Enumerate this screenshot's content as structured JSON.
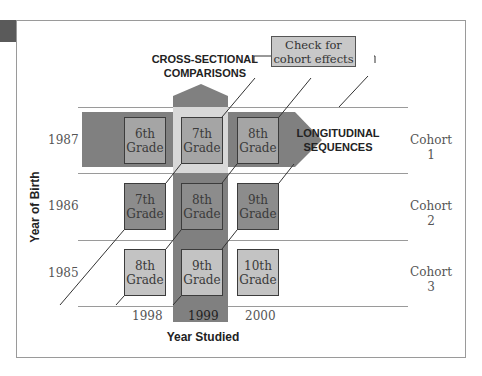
{
  "title_cross_sectional": [
    "CROSS-SECTIONAL",
    "COMPARISONS"
  ],
  "callout": [
    "Check for",
    "cohort effects"
  ],
  "longitudinal": [
    "LONGITUDINAL",
    "SEQUENCES"
  ],
  "y_axis_label": "Year of Birth",
  "x_axis_label": "Year Studied",
  "rows": [
    {
      "year": "1987",
      "cohort": [
        "Cohort",
        "1"
      ],
      "cells": [
        [
          "6th",
          "Grade"
        ],
        [
          "7th",
          "Grade"
        ],
        [
          "8th",
          "Grade"
        ]
      ]
    },
    {
      "year": "1986",
      "cohort": [
        "Cohort",
        "2"
      ],
      "cells": [
        [
          "7th",
          "Grade"
        ],
        [
          "8th",
          "Grade"
        ],
        [
          "9th",
          "Grade"
        ]
      ]
    },
    {
      "year": "1985",
      "cohort": [
        "Cohort",
        "3"
      ],
      "cells": [
        [
          "8th",
          "Grade"
        ],
        [
          "9th",
          "Grade"
        ],
        [
          "10th",
          "Grade"
        ]
      ]
    }
  ],
  "columns": [
    "1998",
    "1999",
    "2000"
  ],
  "colors": {
    "band": "#808080",
    "light_box": "#c3c3c3",
    "mid_box": "#a5a5a5",
    "dark_box": "#8c8c8c"
  }
}
